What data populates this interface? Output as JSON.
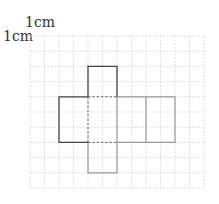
{
  "diagram": {
    "type": "cube-net-on-grid",
    "scale_labels": {
      "horizontal": "1cm",
      "vertical": "1cm"
    },
    "grid": {
      "cols": 12,
      "rows": 10,
      "cell_unit": "1cm",
      "line_color": "#cfcfcf"
    },
    "net": {
      "faces": [
        {
          "name": "top-face",
          "col": 4,
          "row": 2,
          "w": 2,
          "h": 2
        },
        {
          "name": "left-face",
          "col": 2,
          "row": 4,
          "w": 2,
          "h": 3
        },
        {
          "name": "center-face",
          "col": 4,
          "row": 4,
          "w": 2,
          "h": 3,
          "dashed": true
        },
        {
          "name": "right-face-1",
          "col": 6,
          "row": 4,
          "w": 2,
          "h": 3
        },
        {
          "name": "right-face-2",
          "col": 8,
          "row": 4,
          "w": 2,
          "h": 3
        },
        {
          "name": "bottom-face",
          "col": 4,
          "row": 7,
          "w": 2,
          "h": 2
        }
      ],
      "dark_color": "#444444",
      "light_color": "#9a9a9a"
    }
  }
}
